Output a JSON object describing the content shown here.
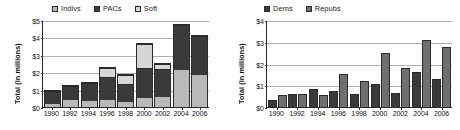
{
  "charts": [
    {
      "id": "contributions-by-source",
      "ylabel": "Total (in millions)",
      "legend": [
        {
          "key": "indivs",
          "label": "Indivs",
          "color": "#b9b9b9"
        },
        {
          "key": "pacs",
          "label": "PACs",
          "color": "#3a3a3a"
        },
        {
          "key": "soft",
          "label": "Soft",
          "color": "#d6d6d6"
        }
      ],
      "yticks": [
        "$0",
        "$1",
        "$2",
        "$3",
        "$4",
        "$5"
      ],
      "xticks": [
        "1990",
        "1992",
        "1994",
        "1996",
        "1998",
        "2000",
        "2002",
        "2004",
        "2006"
      ]
    },
    {
      "id": "contributions-by-party",
      "ylabel": "Total (in millions)",
      "legend": [
        {
          "key": "dems",
          "label": "Dems",
          "color": "#3a3a3a"
        },
        {
          "key": "repubs",
          "label": "Repubs",
          "color": "#6f6f6f"
        }
      ],
      "yticks": [
        "$0",
        "$1",
        "$2",
        "$3",
        "$4"
      ],
      "xticks": [
        "1990",
        "1992",
        "1994",
        "1996",
        "1998",
        "2000",
        "2002",
        "2004",
        "2006"
      ]
    }
  ],
  "chart_data": [
    {
      "type": "bar",
      "subtype": "stacked",
      "title": "",
      "xlabel": "",
      "ylabel": "Total (in millions)",
      "ylim": [
        0,
        5
      ],
      "yticks": [
        0,
        1,
        2,
        3,
        4,
        5
      ],
      "ytick_labels": [
        "$0",
        "$1",
        "$2",
        "$3",
        "$4",
        "$5"
      ],
      "grid": true,
      "legend_position": "top",
      "categories": [
        "1990",
        "1992",
        "1994",
        "1996",
        "1998",
        "2000",
        "2002",
        "2004",
        "2006"
      ],
      "series": [
        {
          "name": "Indivs",
          "color": "#b9b9b9",
          "values": [
            0.15,
            0.4,
            0.32,
            0.42,
            0.3,
            0.52,
            0.57,
            2.15,
            1.82
          ]
        },
        {
          "name": "PACs",
          "color": "#3a3a3a",
          "values": [
            0.75,
            0.82,
            1.06,
            1.28,
            1.05,
            1.72,
            1.62,
            2.57,
            2.28
          ]
        },
        {
          "name": "Soft",
          "color": "#d6d6d6",
          "values": [
            0.0,
            0.0,
            0.0,
            0.55,
            0.5,
            1.38,
            0.26,
            0.0,
            0.0
          ]
        }
      ],
      "totals": [
        0.9,
        1.22,
        1.38,
        2.25,
        1.85,
        3.62,
        2.45,
        4.72,
        4.1
      ]
    },
    {
      "type": "bar",
      "subtype": "grouped",
      "title": "",
      "xlabel": "",
      "ylabel": "Total (in millions)",
      "ylim": [
        0,
        4
      ],
      "yticks": [
        0,
        1,
        2,
        3,
        4
      ],
      "ytick_labels": [
        "$0",
        "$1",
        "$2",
        "$3",
        "$4"
      ],
      "grid": true,
      "legend_position": "top",
      "categories": [
        "1990",
        "1992",
        "1994",
        "1996",
        "1998",
        "2000",
        "2002",
        "2004",
        "2006"
      ],
      "series": [
        {
          "name": "Dems",
          "color": "#3a3a3a",
          "values": [
            0.33,
            0.61,
            0.82,
            0.74,
            0.59,
            1.06,
            0.63,
            1.6,
            1.27
          ]
        },
        {
          "name": "Repubs",
          "color": "#6f6f6f",
          "values": [
            0.55,
            0.61,
            0.55,
            1.52,
            1.2,
            2.5,
            1.79,
            3.07,
            2.77
          ]
        }
      ]
    }
  ]
}
